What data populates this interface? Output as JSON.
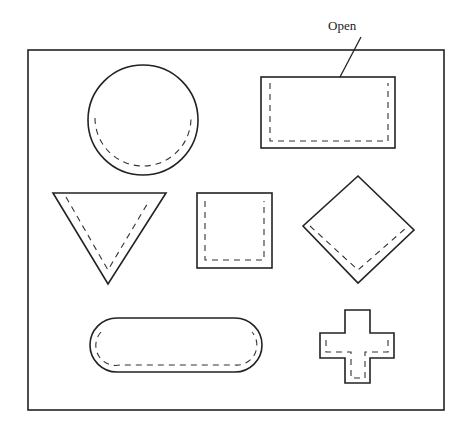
{
  "diagram": {
    "callout_label": "Open",
    "shapes": [
      "circle",
      "rectangle",
      "triangle",
      "square",
      "diamond",
      "rounded-rectangle",
      "cross"
    ],
    "stroke_color": "#222222",
    "background_color": "#ffffff"
  }
}
